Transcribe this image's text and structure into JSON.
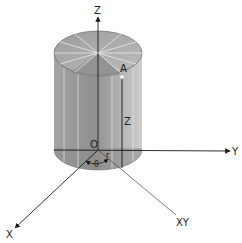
{
  "diagram": {
    "labels": {
      "z_axis": "Z",
      "y_axis": "Y",
      "x_axis": "X",
      "xy_projection": "XY",
      "origin": "O",
      "point": "A",
      "height": "Z",
      "radius": "r",
      "angle": "θ"
    },
    "colors": {
      "background": "#ffffff",
      "cylinder_body": "#9a9a9a",
      "cylinder_body_light": "#c4c4c4",
      "cylinder_top": "#a8a8a8",
      "cylinder_top_sector": "#8a8a8a",
      "bottom_cap": "#8c8c8c",
      "generator_lines": "#e6e6e6",
      "axis": "#1a1a1a",
      "point_marker": "#ffffff"
    }
  }
}
